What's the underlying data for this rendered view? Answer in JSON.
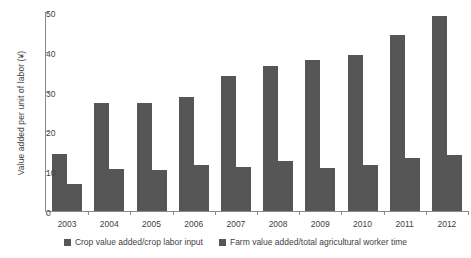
{
  "chart_data": {
    "type": "bar",
    "title": "",
    "xlabel": "",
    "ylabel": "Value added per unit of labor (¥)",
    "categories": [
      "2003",
      "2004",
      "2005",
      "2006",
      "2007",
      "2008",
      "2009",
      "2010",
      "2011",
      "2012"
    ],
    "series": [
      {
        "name": "Crop value added/crop labor input",
        "color": "#565656",
        "values": [
          14.3,
          27.2,
          27.1,
          28.7,
          34.0,
          36.5,
          38.0,
          39.1,
          44.2,
          49.0
        ]
      },
      {
        "name": "Farm value added/total agricultural worker time",
        "color": "#565656",
        "values": [
          6.8,
          10.6,
          10.4,
          11.5,
          11.0,
          12.5,
          10.8,
          11.5,
          13.3,
          14.0
        ]
      }
    ],
    "ylim": [
      0,
      50
    ],
    "yticks": [
      0,
      10,
      20,
      30,
      40,
      50
    ],
    "ytick_labels": [
      "0",
      "10",
      "20",
      "30",
      "40",
      "50"
    ],
    "grid": false,
    "legend_position": "bottom"
  },
  "legend": {
    "items": [
      {
        "label": "Crop value added/crop labor input"
      },
      {
        "label": "Farm value added/total agricultural worker time"
      }
    ]
  }
}
